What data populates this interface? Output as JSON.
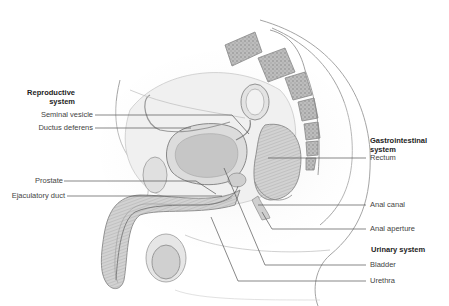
{
  "diagram": {
    "type": "anatomical-sagittal-section",
    "groups": {
      "reproductive": {
        "title": "Reproductive system",
        "title_line1": "Reproductive",
        "title_line2": "system",
        "labels": [
          "Seminal vesicle",
          "Ductus deferens",
          "Prostate",
          "Ejaculatory duct"
        ]
      },
      "gastrointestinal": {
        "title": "Gastrointestinal system",
        "title_line1": "Gastrointestinal",
        "title_line2": "system",
        "labels": [
          "Rectum",
          "Anal canal",
          "Anal aperture"
        ]
      },
      "urinary": {
        "title": "Urinary system",
        "labels": [
          "Bladder",
          "Urethra"
        ]
      }
    },
    "colors": {
      "background": "#ffffff",
      "leader_line": "#555555",
      "tissue_light": "#e6e6e6",
      "tissue_mid": "#c9c9c9",
      "tissue_dark": "#9a9a9a",
      "outline": "#8a8a8a"
    }
  }
}
